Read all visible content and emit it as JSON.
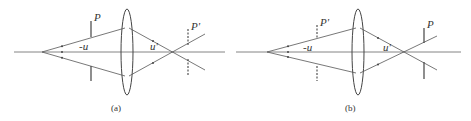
{
  "figure": {
    "colors": {
      "line": "#555555",
      "background": "#ffffff"
    },
    "panels": [
      {
        "id": "a",
        "caption": "(a)",
        "labels": {
          "stop": "P",
          "stop_image": "P'",
          "object_angle": "-u",
          "image_angle": "u'"
        },
        "stop_position": "object side (solid)",
        "stop_image_position": "image side (dashed)"
      },
      {
        "id": "b",
        "caption": "(b)",
        "labels": {
          "stop": "P",
          "stop_image": "P'",
          "object_angle": "-u",
          "image_angle": "u'"
        },
        "stop_position": "image side (solid)",
        "stop_image_position": "object side (dashed)"
      }
    ]
  }
}
